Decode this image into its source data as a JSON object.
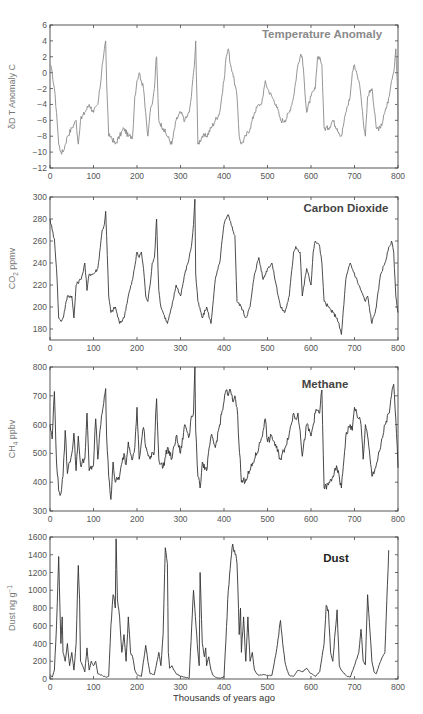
{
  "chart_data": [
    {
      "type": "line",
      "title": "Temperature Anomaly",
      "xlabel": "",
      "ylabel": "δD T Anomaly C",
      "xlim": [
        0,
        800
      ],
      "ylim": [
        -12,
        6
      ],
      "xticks": [
        0,
        100,
        200,
        300,
        400,
        500,
        600,
        700,
        800
      ],
      "yticks": [
        -12,
        -10,
        -8,
        -6,
        -4,
        -2,
        0,
        2,
        4,
        6
      ],
      "color": "#8a8a8a",
      "title_color": "#8a8a8a",
      "x": [
        0,
        5,
        10,
        15,
        20,
        25,
        30,
        40,
        50,
        60,
        65,
        70,
        80,
        90,
        100,
        110,
        115,
        120,
        125,
        128,
        130,
        135,
        140,
        150,
        160,
        170,
        180,
        190,
        195,
        200,
        205,
        210,
        215,
        220,
        225,
        230,
        235,
        240,
        243,
        245,
        250,
        260,
        270,
        280,
        290,
        300,
        310,
        320,
        325,
        330,
        333,
        335,
        340,
        350,
        360,
        370,
        380,
        390,
        395,
        400,
        405,
        410,
        415,
        420,
        430,
        435,
        440,
        450,
        460,
        470,
        480,
        485,
        490,
        495,
        500,
        510,
        520,
        530,
        540,
        550,
        560,
        570,
        575,
        580,
        590,
        600,
        610,
        615,
        620,
        625,
        630,
        640,
        650,
        660,
        670,
        680,
        690,
        695,
        700,
        705,
        710,
        715,
        720,
        725,
        730,
        740,
        750,
        760,
        770,
        780,
        785,
        790,
        795,
        800
      ],
      "values": [
        1,
        0,
        -2,
        -5,
        -9,
        -10,
        -10,
        -8,
        -7,
        -6,
        -9,
        -6,
        -5,
        -4,
        -5,
        -4,
        -2,
        1,
        3,
        4,
        -1,
        -8,
        -8,
        -9,
        -8,
        -7,
        -8,
        -8,
        -3,
        -1,
        0,
        -1,
        -2,
        -5,
        -8,
        -5,
        -4,
        -2,
        1,
        2,
        -6,
        -7,
        -8,
        -9,
        -6,
        -5,
        -6,
        -5,
        -3,
        0,
        2,
        4,
        -9,
        -8,
        -8,
        -7,
        -6,
        -5,
        -3,
        -1,
        2,
        3,
        1,
        0,
        -3,
        -8,
        -9,
        -8,
        -7,
        -5,
        -4,
        -4,
        -3,
        -1,
        -2,
        -3,
        -4,
        -6,
        -6,
        -5,
        -3,
        1,
        2,
        2,
        -5,
        -3,
        -2,
        2,
        2,
        1,
        -7,
        -7,
        -6,
        -7,
        -8,
        -5,
        -3,
        0,
        1,
        0,
        -1,
        -3,
        -6,
        -8,
        -3,
        -2,
        -7,
        -7,
        -5,
        -3,
        -1,
        0,
        3,
        -3,
        -6
      ]
    },
    {
      "type": "line",
      "title": "Carbon Dioxide",
      "xlabel": "",
      "ylabel": "CO₂ ppmv",
      "xlim": [
        0,
        800
      ],
      "ylim": [
        170,
        300
      ],
      "xticks": [
        0,
        100,
        200,
        300,
        400,
        500,
        600,
        700,
        800
      ],
      "yticks": [
        180,
        200,
        220,
        240,
        260,
        280,
        300
      ],
      "color": "#3a3a3a",
      "title_color": "#444444",
      "x": [
        0,
        5,
        10,
        15,
        20,
        25,
        30,
        40,
        50,
        55,
        60,
        70,
        75,
        80,
        85,
        90,
        100,
        110,
        120,
        125,
        128,
        130,
        135,
        140,
        150,
        160,
        170,
        180,
        190,
        200,
        205,
        210,
        215,
        220,
        225,
        230,
        235,
        240,
        243,
        245,
        250,
        255,
        260,
        270,
        280,
        290,
        300,
        310,
        320,
        325,
        330,
        333,
        335,
        340,
        350,
        360,
        370,
        380,
        390,
        400,
        405,
        410,
        415,
        420,
        425,
        430,
        440,
        450,
        460,
        470,
        480,
        490,
        500,
        510,
        520,
        530,
        540,
        550,
        560,
        565,
        570,
        575,
        580,
        590,
        600,
        605,
        610,
        615,
        620,
        625,
        630,
        640,
        650,
        660,
        670,
        680,
        690,
        700,
        710,
        720,
        725,
        730,
        740,
        750,
        760,
        770,
        780,
        785,
        790,
        795,
        800
      ],
      "values": [
        280,
        270,
        262,
        235,
        190,
        187,
        190,
        210,
        210,
        190,
        220,
        225,
        230,
        240,
        215,
        230,
        230,
        235,
        270,
        275,
        287,
        265,
        210,
        195,
        200,
        185,
        190,
        210,
        225,
        250,
        245,
        250,
        235,
        210,
        205,
        220,
        240,
        245,
        265,
        280,
        215,
        200,
        195,
        185,
        200,
        220,
        210,
        230,
        245,
        255,
        275,
        298,
        230,
        205,
        190,
        200,
        185,
        225,
        240,
        275,
        280,
        284,
        278,
        270,
        265,
        205,
        200,
        190,
        200,
        230,
        245,
        225,
        235,
        240,
        220,
        200,
        195,
        210,
        250,
        255,
        252,
        250,
        210,
        235,
        220,
        250,
        260,
        258,
        255,
        240,
        205,
        200,
        195,
        190,
        175,
        225,
        240,
        230,
        220,
        210,
        205,
        210,
        185,
        200,
        230,
        240,
        255,
        260,
        250,
        210,
        195
      ]
    },
    {
      "type": "line",
      "title": "Methane",
      "xlabel": "",
      "ylabel": "CH₄ ppbv",
      "xlim": [
        0,
        800
      ],
      "ylim": [
        300,
        800
      ],
      "xticks": [
        0,
        100,
        200,
        300,
        400,
        500,
        600,
        700,
        800
      ],
      "yticks": [
        300,
        400,
        500,
        600,
        700,
        800
      ],
      "color": "#333333",
      "title_color": "#444444",
      "x": [
        0,
        5,
        10,
        15,
        20,
        25,
        30,
        35,
        40,
        45,
        50,
        55,
        60,
        65,
        70,
        80,
        85,
        90,
        100,
        105,
        110,
        115,
        120,
        125,
        128,
        130,
        135,
        140,
        145,
        150,
        160,
        170,
        175,
        180,
        190,
        195,
        200,
        205,
        210,
        215,
        220,
        230,
        240,
        243,
        245,
        250,
        260,
        270,
        280,
        290,
        300,
        310,
        320,
        325,
        330,
        333,
        335,
        340,
        345,
        350,
        360,
        370,
        380,
        390,
        400,
        405,
        410,
        415,
        420,
        425,
        430,
        440,
        450,
        460,
        470,
        480,
        490,
        495,
        500,
        510,
        520,
        530,
        540,
        550,
        560,
        565,
        570,
        575,
        580,
        590,
        600,
        610,
        615,
        620,
        625,
        630,
        640,
        650,
        660,
        670,
        680,
        690,
        695,
        700,
        705,
        710,
        715,
        720,
        725,
        730,
        740,
        750,
        760,
        770,
        780,
        785,
        790,
        795,
        800
      ],
      "values": [
        600,
        550,
        715,
        470,
        370,
        360,
        420,
        580,
        430,
        470,
        500,
        570,
        440,
        560,
        460,
        480,
        640,
        440,
        460,
        620,
        480,
        580,
        640,
        700,
        725,
        560,
        420,
        340,
        470,
        400,
        420,
        500,
        460,
        540,
        480,
        520,
        660,
        480,
        540,
        590,
        520,
        480,
        510,
        640,
        690,
        480,
        450,
        520,
        480,
        560,
        500,
        600,
        560,
        630,
        640,
        800,
        580,
        420,
        380,
        470,
        440,
        560,
        520,
        600,
        680,
        720,
        700,
        720,
        680,
        700,
        660,
        400,
        410,
        440,
        480,
        520,
        580,
        620,
        540,
        560,
        520,
        480,
        520,
        570,
        640,
        620,
        640,
        580,
        490,
        600,
        560,
        640,
        650,
        640,
        720,
        380,
        390,
        420,
        450,
        380,
        560,
        600,
        580,
        660,
        640,
        620,
        600,
        480,
        600,
        560,
        420,
        460,
        520,
        600,
        640,
        700,
        740,
        620,
        450
      ]
    },
    {
      "type": "line",
      "title": "Dust",
      "xlabel": "Thousands of years ago",
      "ylabel": "Dust ng g⁻¹",
      "xlim": [
        0,
        800
      ],
      "ylim": [
        0,
        1600
      ],
      "xticks": [
        0,
        100,
        200,
        300,
        400,
        500,
        600,
        700,
        800
      ],
      "yticks": [
        0,
        200,
        400,
        600,
        800,
        1000,
        1200,
        1400,
        1600
      ],
      "color": "#333333",
      "title_color": "#222222",
      "x": [
        0,
        5,
        10,
        15,
        20,
        25,
        28,
        30,
        35,
        40,
        45,
        50,
        55,
        60,
        65,
        68,
        70,
        75,
        80,
        85,
        90,
        95,
        100,
        105,
        110,
        115,
        120,
        125,
        130,
        135,
        140,
        145,
        150,
        152,
        155,
        160,
        165,
        170,
        175,
        180,
        185,
        190,
        195,
        200,
        210,
        220,
        225,
        230,
        240,
        250,
        255,
        260,
        265,
        270,
        272,
        275,
        280,
        285,
        290,
        300,
        310,
        320,
        330,
        340,
        343,
        345,
        350,
        355,
        358,
        360,
        365,
        370,
        375,
        380,
        390,
        400,
        410,
        420,
        430,
        435,
        438,
        440,
        445,
        450,
        455,
        460,
        465,
        470,
        475,
        480,
        490,
        500,
        510,
        520,
        530,
        535,
        540,
        545,
        550,
        560,
        570,
        580,
        590,
        600,
        610,
        620,
        630,
        635,
        640,
        645,
        650,
        660,
        665,
        670,
        680,
        690,
        700,
        710,
        715,
        720,
        725,
        730,
        740,
        745,
        750,
        760,
        770,
        780,
        790,
        795,
        800
      ],
      "values": [
        50,
        20,
        100,
        600,
        1380,
        400,
        700,
        300,
        200,
        400,
        150,
        300,
        100,
        400,
        1280,
        900,
        200,
        150,
        80,
        350,
        100,
        200,
        150,
        200,
        60,
        50,
        40,
        30,
        20,
        30,
        600,
        950,
        800,
        1580,
        900,
        700,
        300,
        500,
        200,
        700,
        300,
        250,
        100,
        50,
        30,
        380,
        200,
        60,
        50,
        300,
        150,
        500,
        1480,
        1300,
        300,
        120,
        150,
        100,
        60,
        30,
        20,
        10,
        1000,
        300,
        150,
        1200,
        400,
        250,
        350,
        150,
        250,
        100,
        40,
        20,
        10,
        20,
        1000,
        1520,
        1300,
        500,
        800,
        300,
        700,
        200,
        700,
        200,
        300,
        100,
        60,
        40,
        50,
        40,
        40,
        300,
        660,
        400,
        200,
        100,
        40,
        30,
        100,
        80,
        120,
        60,
        30,
        80,
        400,
        830,
        780,
        300,
        200,
        780,
        150,
        100,
        40,
        20,
        150,
        300,
        560,
        200,
        160,
        950,
        200,
        80,
        60,
        200,
        300,
        1600
      ]
    }
  ],
  "panels": [
    {
      "title": "Temperature Anomaly",
      "ylabel": "δD T Anomaly C"
    },
    {
      "title": "Carbon Dioxide",
      "ylabel_main": "CO",
      "ylabel_sub": "2",
      "ylabel_tail": " ppmv"
    },
    {
      "title": "Methane",
      "ylabel_main": "CH",
      "ylabel_sub": "4",
      "ylabel_tail": " ppbv"
    },
    {
      "title": "Dust",
      "ylabel_main": "Dust ng g",
      "ylabel_sup": "−1"
    }
  ],
  "xlabel": "Thousands of years ago"
}
